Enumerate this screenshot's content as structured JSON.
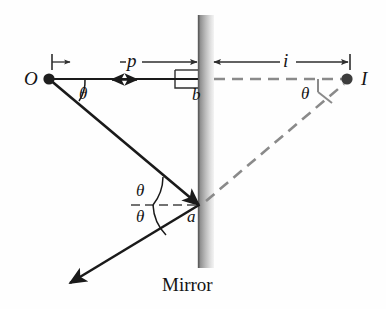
{
  "figure": {
    "caption": "Mirror",
    "colors": {
      "ray": "#1a1a1a",
      "virtual_ray": "#8a8a8a",
      "mirror_dark": "#6f6f6f",
      "mirror_light": "#f2f2f2",
      "dimension": "#3a3a3a",
      "text": "#141414"
    },
    "points": {
      "object": "O",
      "image": "I",
      "reflection_point": "a",
      "mirror_foot": "b"
    },
    "distances": {
      "object_distance": "p",
      "image_distance": "i"
    },
    "angles": {
      "at_object": "θ",
      "incidence": "θ",
      "reflection": "θ",
      "at_image": "θ"
    },
    "geometry": {
      "O": [
        49,
        79
      ],
      "I": [
        348,
        79
      ],
      "a": [
        200,
        205
      ],
      "b": [
        200,
        79
      ],
      "mirror_x": 198,
      "mirror_width": 16,
      "mirror_top": 15,
      "mirror_bottom": 268,
      "reflected_tip": [
        68,
        284
      ],
      "dim_y": 62,
      "dim_left_tick": 52
    }
  }
}
